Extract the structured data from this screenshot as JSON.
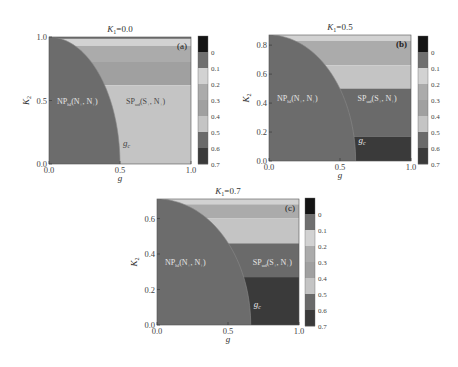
{
  "figure": {
    "width": 458,
    "height": 367,
    "background": "#ffffff"
  },
  "colorbar": {
    "ticks": [
      "0",
      "0.1",
      "0.2",
      "0.3",
      "0.4",
      "0.5",
      "0.6",
      "0.7"
    ],
    "levels": [
      {
        "range": "top",
        "color": "#141414"
      },
      {
        "range": "0-0.1",
        "color": "#6f6f6f"
      },
      {
        "range": "0.1-0.2",
        "color": "#d2d2d2"
      },
      {
        "range": "0.2-0.3",
        "color": "#ababab"
      },
      {
        "range": "0.3-0.4",
        "color": "#a0a0a0"
      },
      {
        "range": "0.4-0.5",
        "color": "#c4c4c4"
      },
      {
        "range": "0.5-0.6",
        "color": "#6a6a6a"
      },
      {
        "range": "0.6-0.7",
        "color": "#3a3a3a"
      }
    ]
  },
  "chart_data": [
    {
      "type": "heatmap",
      "panel_label": "(a)",
      "title": "K1=0.0",
      "title_var": "K",
      "title_sub": "1",
      "title_val": "=0.0",
      "xlabel": "g",
      "ylabel": "K2",
      "xlim": [
        0.0,
        1.0
      ],
      "ylim": [
        0.0,
        1.0
      ],
      "xticks": [
        "0.0",
        "0.5",
        "1.0"
      ],
      "xtick_values": [
        0.0,
        0.5,
        1.0
      ],
      "yticks": [
        "0.0",
        "0.5",
        "1.0"
      ],
      "ytick_values": [
        0.0,
        0.5,
        1.0
      ],
      "np_region": {
        "label": "NP",
        "sub": "hl",
        "rest": "(N",
        "sub2": "+",
        "rest2": ", N",
        "sub3": "+",
        "rest3": ")",
        "color": "#6c6c6c",
        "g_c_at_K2_0": 0.5,
        "K2_at_g_0": 1.0
      },
      "sp_region": {
        "label": "SP",
        "sub": "ud",
        "rest": "(S",
        "sub2": "+",
        "rest2": ", N",
        "sub3": "+",
        "rest3": ")"
      },
      "boundary_label": "g",
      "boundary_sub": "c",
      "sp_bands": [
        {
          "y0": 0.985,
          "y1": 1.0,
          "color": "#6f6f6f"
        },
        {
          "y0": 0.93,
          "y1": 0.985,
          "color": "#d2d2d2"
        },
        {
          "y0": 0.81,
          "y1": 0.93,
          "color": "#ababab"
        },
        {
          "y0": 0.62,
          "y1": 0.81,
          "color": "#a0a0a0"
        },
        {
          "y0": 0.0,
          "y1": 0.62,
          "color": "#c4c4c4"
        }
      ],
      "layout": {
        "x": 49,
        "y": 37,
        "w": 142,
        "h": 127,
        "cbx": 198,
        "cby": 36,
        "cbw": 10,
        "cbh": 128
      }
    },
    {
      "type": "heatmap",
      "panel_label": "(b)",
      "title": "K1=0.5",
      "title_var": "K",
      "title_sub": "1",
      "title_val": "=0.5",
      "xlabel": "g",
      "ylabel": "K2",
      "xlim": [
        0.0,
        1.0
      ],
      "ylim": [
        0.0,
        0.87
      ],
      "xticks": [
        "0.0",
        "0.5",
        "1.0"
      ],
      "xtick_values": [
        0.0,
        0.5,
        1.0
      ],
      "yticks": [
        "0.0",
        "0.2",
        "0.4",
        "0.6",
        "0.8"
      ],
      "ytick_values": [
        0.0,
        0.2,
        0.4,
        0.6,
        0.8
      ],
      "np_region": {
        "label": "NP",
        "sub": "hl",
        "rest": "(N",
        "sub2": "+",
        "rest2": ", N",
        "sub3": "+",
        "rest3": ")",
        "color": "#6c6c6c",
        "g_c_at_K2_0": 0.61,
        "K2_at_g_0": 0.87
      },
      "sp_region": {
        "label": "SP",
        "sub": "ud",
        "rest": "(S",
        "sub2": "+",
        "rest2": ", N",
        "sub3": "+",
        "rest3": ")"
      },
      "boundary_label": "g",
      "boundary_sub": "c",
      "sp_bands": [
        {
          "y0": 0.83,
          "y1": 0.87,
          "color": "#d2d2d2"
        },
        {
          "y0": 0.66,
          "y1": 0.83,
          "color": "#ababab"
        },
        {
          "y0": 0.5,
          "y1": 0.66,
          "color": "#c4c4c4"
        },
        {
          "y0": 0.17,
          "y1": 0.5,
          "color": "#6a6a6a"
        },
        {
          "y0": 0.0,
          "y1": 0.17,
          "color": "#3a3a3a"
        }
      ],
      "layout": {
        "x": 269,
        "y": 35,
        "w": 142,
        "h": 126,
        "cbx": 418,
        "cby": 36,
        "cbw": 10,
        "cbh": 128
      }
    },
    {
      "type": "heatmap",
      "panel_label": "(c)",
      "title": "K1=0.7",
      "title_var": "K",
      "title_sub": "1",
      "title_val": "=0.7",
      "xlabel": "g",
      "ylabel": "K2",
      "xlim": [
        0.0,
        1.0
      ],
      "ylim": [
        0.0,
        0.71
      ],
      "xticks": [
        "0.0",
        "0.5",
        "1.0"
      ],
      "xtick_values": [
        0.0,
        0.5,
        1.0
      ],
      "yticks": [
        "0.0",
        "0.2",
        "0.4",
        "0.6"
      ],
      "ytick_values": [
        0.0,
        0.2,
        0.4,
        0.6
      ],
      "np_region": {
        "label": "NP",
        "sub": "hl",
        "rest": "(N",
        "sub2": "+",
        "rest2": ", N",
        "sub3": "+",
        "rest3": ")",
        "color": "#6c6c6c",
        "g_c_at_K2_0": 0.66,
        "K2_at_g_0": 0.71
      },
      "sp_region": {
        "label": "SP",
        "sub": "ud",
        "rest": "(S",
        "sub2": "+",
        "rest2": ", N",
        "sub3": "+",
        "rest3": ")"
      },
      "boundary_label": "g",
      "boundary_sub": "c",
      "sp_bands": [
        {
          "y0": 0.68,
          "y1": 0.71,
          "color": "#d2d2d2"
        },
        {
          "y0": 0.6,
          "y1": 0.68,
          "color": "#ababab"
        },
        {
          "y0": 0.46,
          "y1": 0.6,
          "color": "#c4c4c4"
        },
        {
          "y0": 0.27,
          "y1": 0.46,
          "color": "#6a6a6a"
        },
        {
          "y0": 0.0,
          "y1": 0.27,
          "color": "#3a3a3a"
        }
      ],
      "layout": {
        "x": 157,
        "y": 199,
        "w": 142,
        "h": 126,
        "cbx": 305,
        "cby": 198,
        "cbw": 10,
        "cbh": 128
      }
    }
  ]
}
